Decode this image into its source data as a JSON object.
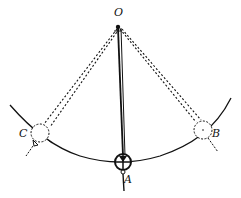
{
  "diagram": {
    "labels": {
      "pivot": "O",
      "bottom": "A",
      "right": "B",
      "left": "C"
    },
    "colors": {
      "ink": "#111111",
      "background": "#ffffff"
    }
  }
}
